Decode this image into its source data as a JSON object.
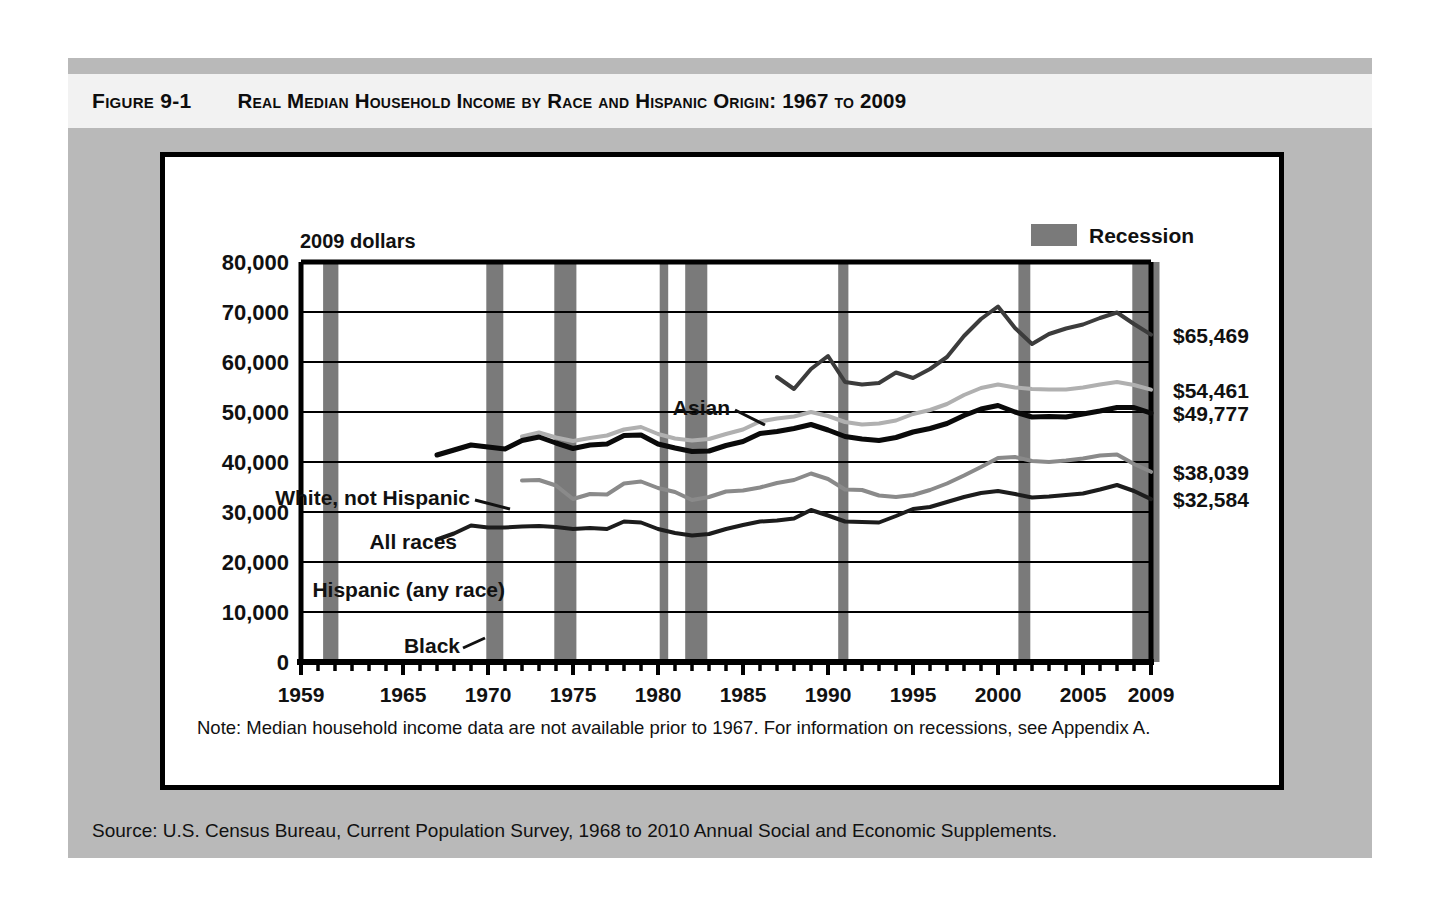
{
  "figure": {
    "label": "Figure 9-1",
    "title": "Real Median Household Income by Race and Hispanic Origin: 1967 to 2009"
  },
  "note": {
    "text": "Note: Median household income data are not available prior to 1967. For information on recessions, see Appendix A."
  },
  "source": {
    "text": "Source: U.S. Census Bureau, Current Population Survey, 1968 to 2010 Annual Social and Economic Supplements."
  },
  "legend": {
    "recession_label": "Recession",
    "recession_color": "#7a7a7a"
  },
  "chart_data": {
    "type": "line",
    "title": "Real Median Household Income by Race and Hispanic Origin: 1967 to 2009",
    "xlabel": "",
    "ylabel": "2009 dollars",
    "units_note": "2009 dollars",
    "xlim": [
      1959,
      2009
    ],
    "ylim": [
      0,
      80000
    ],
    "grid": "horizontal",
    "legend_position": "inline-labels",
    "y_ticks": [
      0,
      10000,
      20000,
      30000,
      40000,
      50000,
      60000,
      70000,
      80000
    ],
    "y_tick_labels": [
      "0",
      "10,000",
      "20,000",
      "30,000",
      "40,000",
      "50,000",
      "60,000",
      "70,000",
      "80,000"
    ],
    "x_ticks": [
      1959,
      1965,
      1970,
      1975,
      1980,
      1985,
      1990,
      1995,
      2000,
      2005,
      2009
    ],
    "x_tick_labels": [
      "1959",
      "1965",
      "1970",
      "1975",
      "1980",
      "1985",
      "1990",
      "1995",
      "2000",
      "2005",
      "2009"
    ],
    "x_minor_tick_interval": 1,
    "recessions": [
      {
        "start": 1960.3,
        "end": 1961.2
      },
      {
        "start": 1969.9,
        "end": 1970.9
      },
      {
        "start": 1973.9,
        "end": 1975.2
      },
      {
        "start": 1980.1,
        "end": 1980.6
      },
      {
        "start": 1981.6,
        "end": 1982.9
      },
      {
        "start": 1990.6,
        "end": 1991.2
      },
      {
        "start": 2001.2,
        "end": 2001.9
      },
      {
        "start": 2007.9,
        "end": 2009.5
      }
    ],
    "series": [
      {
        "name": "Asian",
        "label": "Asian",
        "color": "#3c3c3c",
        "width": 4,
        "end_label": "$65,469",
        "end_value": 65469,
        "x": [
          1987,
          1988,
          1989,
          1990,
          1991,
          1992,
          1993,
          1994,
          1995,
          1996,
          1997,
          1998,
          1999,
          2000,
          2001,
          2002,
          2003,
          2004,
          2005,
          2006,
          2007,
          2008,
          2009
        ],
        "values": [
          57000,
          54600,
          58600,
          61200,
          56000,
          55500,
          55800,
          57900,
          56800,
          58600,
          61000,
          65200,
          68600,
          71100,
          66800,
          63600,
          65600,
          66700,
          67500,
          68800,
          69900,
          67600,
          65469
        ]
      },
      {
        "name": "White, not Hispanic",
        "label": "White, not Hispanic",
        "color": "#b0b0b0",
        "width": 4,
        "end_label": "$54,461",
        "end_value": 54461,
        "x": [
          1972,
          1973,
          1974,
          1975,
          1976,
          1977,
          1978,
          1979,
          1980,
          1981,
          1982,
          1983,
          1984,
          1985,
          1986,
          1987,
          1988,
          1989,
          1990,
          1991,
          1992,
          1993,
          1994,
          1995,
          1996,
          1997,
          1998,
          1999,
          2000,
          2001,
          2002,
          2003,
          2004,
          2005,
          2006,
          2007,
          2008,
          2009
        ],
        "values": [
          45100,
          45900,
          44900,
          44200,
          44800,
          45300,
          46500,
          47000,
          45600,
          44700,
          44300,
          44600,
          45600,
          46500,
          48100,
          48700,
          49100,
          50000,
          49200,
          48000,
          47500,
          47700,
          48300,
          49600,
          50400,
          51600,
          53400,
          54800,
          55500,
          54900,
          54600,
          54500,
          54500,
          54900,
          55500,
          56000,
          55400,
          54461
        ]
      },
      {
        "name": "All races",
        "label": "All races",
        "color": "#0a0a0a",
        "width": 5,
        "end_label": "$49,777",
        "end_value": 49777,
        "x": [
          1967,
          1968,
          1969,
          1970,
          1971,
          1972,
          1973,
          1974,
          1975,
          1976,
          1977,
          1978,
          1979,
          1980,
          1981,
          1982,
          1983,
          1984,
          1985,
          1986,
          1987,
          1988,
          1989,
          1990,
          1991,
          1992,
          1993,
          1994,
          1995,
          1996,
          1997,
          1998,
          1999,
          2000,
          2001,
          2002,
          2003,
          2004,
          2005,
          2006,
          2007,
          2008,
          2009
        ],
        "values": [
          41400,
          42400,
          43400,
          43000,
          42600,
          44300,
          45000,
          43800,
          42700,
          43400,
          43600,
          45300,
          45400,
          43600,
          42800,
          42100,
          42200,
          43300,
          44100,
          45700,
          46100,
          46700,
          47500,
          46400,
          45100,
          44600,
          44300,
          44900,
          46000,
          46700,
          47700,
          49300,
          50600,
          51300,
          50000,
          49000,
          49100,
          49000,
          49600,
          50200,
          50900,
          50900,
          49777
        ]
      },
      {
        "name": "Hispanic (any race)",
        "label": "Hispanic (any race)",
        "color": "#8a8a8a",
        "width": 4,
        "end_label": "$38,039",
        "end_value": 38039,
        "x": [
          1972,
          1973,
          1974,
          1975,
          1976,
          1977,
          1978,
          1979,
          1980,
          1981,
          1982,
          1983,
          1984,
          1985,
          1986,
          1987,
          1988,
          1989,
          1990,
          1991,
          1992,
          1993,
          1994,
          1995,
          1996,
          1997,
          1998,
          1999,
          2000,
          2001,
          2002,
          2003,
          2004,
          2005,
          2006,
          2007,
          2008,
          2009
        ],
        "values": [
          36300,
          36400,
          35300,
          32600,
          33600,
          33500,
          35700,
          36100,
          34800,
          34000,
          32400,
          33000,
          34100,
          34300,
          34900,
          35800,
          36400,
          37700,
          36600,
          34500,
          34400,
          33300,
          33000,
          33400,
          34400,
          35700,
          37300,
          39000,
          40800,
          41000,
          40200,
          40000,
          40300,
          40700,
          41300,
          41500,
          39600,
          38039
        ]
      },
      {
        "name": "Black",
        "label": "Black",
        "color": "#1c1c1c",
        "width": 4,
        "end_label": "$32,584",
        "end_value": 32584,
        "x": [
          1967,
          1968,
          1969,
          1970,
          1971,
          1972,
          1973,
          1974,
          1975,
          1976,
          1977,
          1978,
          1979,
          1980,
          1981,
          1982,
          1983,
          1984,
          1985,
          1986,
          1987,
          1988,
          1989,
          1990,
          1991,
          1992,
          1993,
          1994,
          1995,
          1996,
          1997,
          1998,
          1999,
          2000,
          2001,
          2002,
          2003,
          2004,
          2005,
          2006,
          2007,
          2008,
          2009
        ],
        "values": [
          24500,
          25700,
          27300,
          26900,
          26900,
          27100,
          27200,
          27000,
          26600,
          26800,
          26600,
          28100,
          27900,
          26600,
          25800,
          25300,
          25600,
          26600,
          27400,
          28100,
          28300,
          28700,
          30400,
          29300,
          28100,
          28000,
          27900,
          29200,
          30600,
          31000,
          32000,
          33000,
          33800,
          34200,
          33600,
          32900,
          33100,
          33400,
          33700,
          34500,
          35400,
          34200,
          32584
        ]
      }
    ]
  },
  "axis": {
    "units_label": "2009 dollars"
  }
}
